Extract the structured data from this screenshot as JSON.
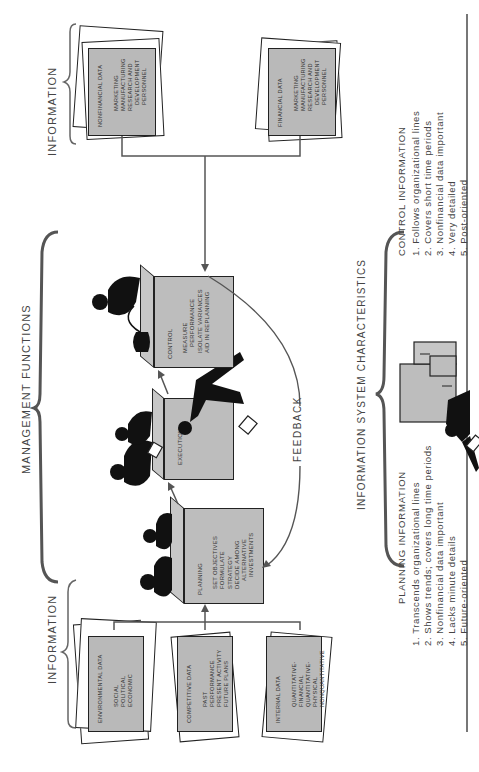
{
  "headers": {
    "information_left": "INFORMATION",
    "management_functions": "MANAGEMENT FUNCTIONS",
    "information_right": "INFORMATION",
    "info_system_characteristics": "INFORMATION SYSTEM CHARACTERISTICS"
  },
  "input_cards": [
    {
      "title": "ENVIRONMENTAL DATA",
      "items": [
        "SOCIAL",
        "POLITICAL",
        "ECONOMIC"
      ]
    },
    {
      "title": "COMPETITIVE DATA",
      "items": [
        "PAST PERFORMANCE",
        "PRESENT ACTIVITY",
        "FUTURE PLANS"
      ]
    },
    {
      "title": "INTERNAL DATA",
      "items": [
        "QUANTITATIVE-FINANCIAL",
        "QUANTITATIVE-PHYSICAL",
        "NONQUANTITATIVE"
      ]
    }
  ],
  "output_cards": [
    {
      "title": "NONFINANCIAL DATA",
      "items": [
        "MARKETING",
        "MANUFACTURING",
        "RESEARCH AND",
        "DEVELOPMENT",
        "PERSONNEL"
      ]
    },
    {
      "title": "FINANCIAL DATA",
      "items": [
        "MARKETING",
        "MANUFACTURING",
        "RESEARCH AND",
        "DEVELOPMENT",
        "PERSONNEL"
      ]
    }
  ],
  "functions": [
    {
      "title": "PLANNING",
      "items": [
        "SET OBJECTIVES",
        "FORMULATE STRATEGY",
        "DECIDE AMONG",
        "ALTERNATIVE",
        "INVESTMENTS"
      ]
    },
    {
      "title": "EXECUTION",
      "items": []
    },
    {
      "title": "CONTROL",
      "items": [
        "MEASURE",
        "PERFORMANCE",
        "ISOLATE VARIANCES",
        "AID IN REPLANNING"
      ]
    }
  ],
  "feedback_label": "FEEDBACK",
  "planning_information": {
    "title": "PLANNING INFORMATION",
    "items": [
      "1. Transcends organizational lines",
      "2. Shows trends; covers long time periods",
      "3. Nonfinancial data important",
      "4. Lacks minute details",
      "5. Future-oriented"
    ]
  },
  "control_information": {
    "title": "CONTROL INFORMATION",
    "items": [
      "1. Follows organizational lines",
      "2. Covers short time periods",
      "3. Nonfinancial data important",
      "4. Very detailed",
      "5. Post-oriented"
    ]
  },
  "colors": {
    "card_fill": "#b9b9b9",
    "box_fill": "#bdbdbd",
    "line": "#555555",
    "silhouette": "#111111",
    "text": "#444444"
  }
}
